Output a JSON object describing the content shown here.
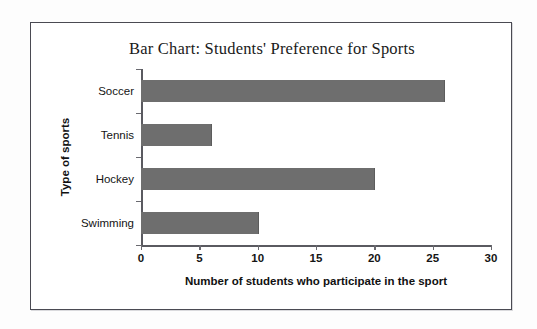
{
  "figure": {
    "title": "Bar Chart: Students' Preference for Sports",
    "frame_color": "#4a4a52",
    "background": "#ffffff"
  },
  "chart_data": {
    "type": "bar",
    "orientation": "horizontal",
    "title": "Bar Chart: Students' Preference for Sports",
    "categories": [
      "Soccer",
      "Tennis",
      "Hockey",
      "Swimming"
    ],
    "values": [
      26,
      6,
      20,
      10
    ],
    "xlabel": "Number of students who participate in the sport",
    "ylabel": "Type of sports",
    "xlim": [
      0,
      30
    ],
    "xticks": [
      0,
      5,
      10,
      15,
      20,
      25,
      30
    ],
    "xtick_labels": [
      "0",
      "5",
      "10",
      "15",
      "20",
      "25",
      "30"
    ],
    "grid": false,
    "legend": null,
    "bar_color": "#6e6e6e",
    "axis_color": "#5a5a60"
  }
}
